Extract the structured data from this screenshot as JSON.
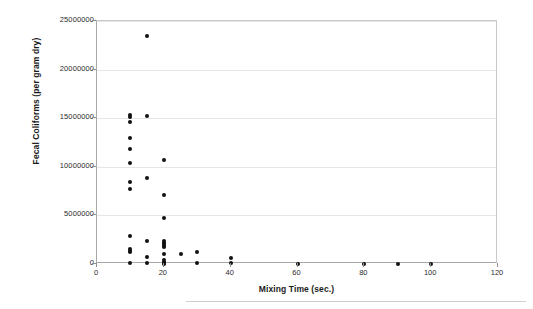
{
  "chart_data": {
    "type": "scatter",
    "title": "",
    "xlabel": "Mixing Time (sec.)",
    "ylabel": "Fecal Coliforms (per gram dry)",
    "xlim": [
      0,
      120
    ],
    "ylim": [
      0,
      25000000
    ],
    "xticks": [
      0,
      20,
      40,
      60,
      80,
      100,
      120
    ],
    "xtick_labels": [
      "0",
      "20",
      "40",
      "60",
      "80",
      "100",
      "120"
    ],
    "yticks": [
      0,
      5000000,
      10000000,
      15000000,
      20000000,
      25000000
    ],
    "ytick_labels": [
      "0",
      "5000000",
      "10000000",
      "15000000",
      "20000000",
      "25000000"
    ],
    "grid": true,
    "grid_axis": "y",
    "legend": false,
    "marker": "diamond",
    "marker_color": "#111111",
    "series": [
      {
        "name": "Fecal Coliforms",
        "points": [
          [
            10,
            15300000
          ],
          [
            10,
            15100000
          ],
          [
            10,
            14600000
          ],
          [
            10,
            13000000
          ],
          [
            10,
            11800000
          ],
          [
            10,
            10400000
          ],
          [
            10,
            8400000
          ],
          [
            10,
            7700000
          ],
          [
            10,
            2900000
          ],
          [
            10,
            1500000
          ],
          [
            10,
            1350000
          ],
          [
            10,
            1250000
          ],
          [
            10,
            100000
          ],
          [
            15,
            15200000
          ],
          [
            15,
            8800000
          ],
          [
            15,
            2400000
          ],
          [
            15,
            700000
          ],
          [
            15,
            60000
          ],
          [
            20,
            10650000
          ],
          [
            20,
            7150000
          ],
          [
            20,
            4750000
          ],
          [
            20,
            2350000
          ],
          [
            20,
            2200000
          ],
          [
            20,
            2050000
          ],
          [
            20,
            1900000
          ],
          [
            20,
            1750000
          ],
          [
            20,
            1000000
          ],
          [
            20,
            400000
          ],
          [
            20,
            250000
          ],
          [
            20,
            120000
          ],
          [
            20,
            50000
          ],
          [
            25,
            1000000
          ],
          [
            30,
            1200000
          ],
          [
            30,
            60000
          ],
          [
            40,
            600000
          ],
          [
            40,
            60000
          ],
          [
            60,
            50000
          ],
          [
            80,
            50000
          ],
          [
            90,
            50000
          ],
          [
            100,
            50000
          ],
          [
            15,
            23500000
          ]
        ]
      }
    ]
  }
}
